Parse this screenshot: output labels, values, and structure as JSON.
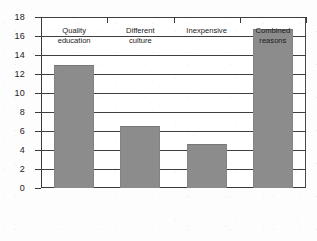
{
  "chart_data": {
    "type": "bar",
    "title": "",
    "subtitle": "",
    "xlabel": "",
    "ylabel": "",
    "categories": [
      "Quality education",
      "Different culture",
      "Inexpensive",
      "Combined reasons"
    ],
    "category_lines": [
      [
        "Quality",
        "education"
      ],
      [
        "Different",
        "culture"
      ],
      [
        "Inexpensive"
      ],
      [
        "Combined",
        "reasons"
      ]
    ],
    "values": [
      12.9,
      6.5,
      4.6,
      16.7
    ],
    "ylim": [
      0,
      18
    ],
    "ytick_step": 2,
    "yticks": [
      0,
      2,
      4,
      6,
      8,
      10,
      12,
      14,
      16,
      18
    ],
    "ytick_labels": [
      "0",
      "2",
      "4",
      "6",
      "8",
      "10",
      "12",
      "14",
      "16",
      "18"
    ],
    "grid": true,
    "grid_axis": "y",
    "legend": false,
    "legend_position": "none",
    "bar_color": "#8c8c8c",
    "axis_color": "#3a3a3a",
    "grid_color": "#3f3f3f",
    "background_color": "#ffffff",
    "series": [
      {
        "name": "Count",
        "values": [
          12.9,
          6.5,
          4.6,
          16.7
        ]
      }
    ]
  }
}
